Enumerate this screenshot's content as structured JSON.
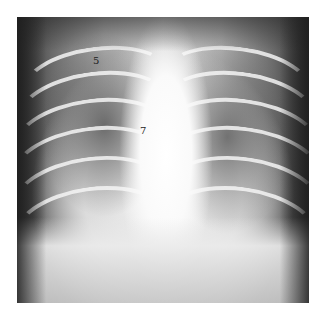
{
  "image": {
    "description": "Grayscale chest radiograph (frontal view) of an infant showing ribs, lung fields and bright central mediastinum",
    "labels": [
      {
        "text": "5",
        "x": 93,
        "y": 58
      },
      {
        "text": "7",
        "x": 141,
        "y": 128
      }
    ]
  }
}
